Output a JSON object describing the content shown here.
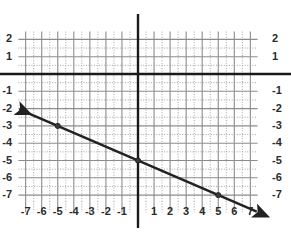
{
  "chart_data": {
    "type": "line",
    "title": "",
    "xlabel": "",
    "ylabel": "",
    "xlim": [
      -7.8,
      7.8
    ],
    "ylim": [
      -7.9,
      2.6
    ],
    "grid": true,
    "grid_minor": true,
    "legend": "none",
    "x_tick_labels": [
      "-7",
      "-6",
      "-5",
      "-4",
      "-3",
      "-2",
      "-1",
      "1",
      "2",
      "3",
      "4",
      "5",
      "6",
      "7"
    ],
    "x_tick_values": [
      -7,
      -6,
      -5,
      -4,
      -3,
      -2,
      -1,
      1,
      2,
      3,
      4,
      5,
      6,
      7
    ],
    "y_tick_labels_left": [
      "2",
      "1",
      "-1",
      "-2",
      "-3",
      "-4",
      "-5",
      "-6",
      "-7"
    ],
    "y_tick_labels_right": [
      "2",
      "1",
      "-1",
      "-2",
      "-3",
      "-4",
      "-5",
      "-6",
      "-7"
    ],
    "y_tick_values": [
      2,
      1,
      -1,
      -2,
      -3,
      -4,
      -5,
      -6,
      -7
    ],
    "series": [
      {
        "name": "line",
        "slope": -0.4,
        "intercept": -5,
        "x": [
          -7.4,
          7.4
        ],
        "y": [
          -2.04,
          -7.96
        ],
        "points": [
          {
            "x": -5,
            "y": -3
          },
          {
            "x": 0,
            "y": -5
          },
          {
            "x": 5,
            "y": -7
          }
        ],
        "arrow_start": true,
        "arrow_end": true,
        "color": "#222222"
      }
    ],
    "colors": {
      "line": "#222222",
      "point": "#3a3a3a",
      "axis": "#1a1a1a",
      "grid_major": "#8c8c8c",
      "grid_minor": "#9a9a9a",
      "label": "#2b2b2b",
      "background": "#ffffff"
    }
  }
}
